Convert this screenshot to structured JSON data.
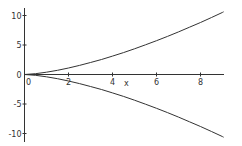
{
  "chart_data": {
    "type": "line",
    "title": "",
    "xlabel": "x",
    "ylabel": "",
    "xlim": [
      0,
      9.1
    ],
    "ylim": [
      -11,
      11
    ],
    "grid": false,
    "legend": null,
    "x_ticks": [
      0,
      2,
      4,
      6,
      8
    ],
    "x_tick_labels": [
      "0",
      "2",
      "4",
      "6",
      "8"
    ],
    "y_ticks": [
      -10,
      -5,
      0,
      5,
      10
    ],
    "y_tick_labels": [
      "-10",
      "-5",
      "0",
      "5",
      "10"
    ],
    "series": [
      {
        "name": "upper branch",
        "x": [
          0,
          0.5,
          1,
          1.5,
          2,
          2.5,
          3,
          3.5,
          4,
          4.5,
          5,
          5.5,
          6,
          6.5,
          7,
          7.5,
          8,
          8.5,
          9,
          9.05
        ],
        "values": [
          0,
          0.14,
          0.39,
          0.72,
          1.1,
          1.54,
          2.03,
          2.55,
          3.12,
          3.72,
          4.36,
          5.03,
          5.73,
          6.46,
          7.22,
          8.01,
          8.82,
          9.66,
          10.53,
          10.62
        ],
        "color": "#333333"
      },
      {
        "name": "lower branch",
        "x": [
          0,
          0.5,
          1,
          1.5,
          2,
          2.5,
          3,
          3.5,
          4,
          4.5,
          5,
          5.5,
          6,
          6.5,
          7,
          7.5,
          8,
          8.5,
          9,
          9.05
        ],
        "values": [
          0,
          -0.14,
          -0.39,
          -0.72,
          -1.1,
          -1.54,
          -2.03,
          -2.55,
          -3.12,
          -3.72,
          -4.36,
          -5.03,
          -5.73,
          -6.46,
          -7.22,
          -8.01,
          -8.82,
          -9.66,
          -10.53,
          -10.62
        ],
        "color": "#333333"
      }
    ]
  },
  "layout": {
    "axis_color": "#333333",
    "origin_px": [
      24.5,
      74.5
    ],
    "x_px_per_unit": 22,
    "y_px_per_unit": 5.9,
    "x_axis_end_px": 224,
    "y_axis_top_px": 8,
    "y_axis_bottom_px": 142,
    "xlabel_pos_px": [
      124,
      86
    ]
  }
}
